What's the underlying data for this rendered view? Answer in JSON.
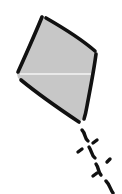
{
  "image": {
    "subject": "kite-icon",
    "style": "hand-drawn sketch",
    "width": 122,
    "height": 194
  },
  "colors": {
    "background": "#ffffff",
    "fill": "#c7c7c7",
    "stroke": "#111111",
    "crossbar": "#f4f4f4"
  }
}
